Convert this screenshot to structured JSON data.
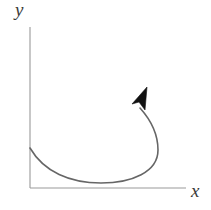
{
  "figure": {
    "type": "vector-diagram",
    "width": 211,
    "height": 210,
    "background_color": "#ffffff"
  },
  "axes": {
    "color": "#999999",
    "stroke_width": 1.1,
    "origin": {
      "x": 30,
      "y": 188
    },
    "y_axis": {
      "label": "y",
      "from": {
        "x": 30,
        "y": 27
      },
      "to": {
        "x": 30,
        "y": 188
      },
      "label_position": {
        "x": 17,
        "y": 3
      }
    },
    "x_axis": {
      "label": "x",
      "from": {
        "x": 30,
        "y": 188
      },
      "to": {
        "x": 186,
        "y": 188
      },
      "label_position": {
        "x": 192,
        "y": 185
      }
    }
  },
  "curve": {
    "name": "trajectory",
    "color": "#666666",
    "stroke_width": 1.6,
    "start_point": {
      "x": 30,
      "y": 148
    },
    "end_point": {
      "x": 140,
      "y": 108
    },
    "lowest_point": {
      "x": 101,
      "y": 183
    },
    "rightmost_point": {
      "x": 158,
      "y": 152
    },
    "path": "M 30 148 C 44 172, 70 183, 101 183 C 132 183, 158 172, 158 150 C 158 132, 149 118, 140 108",
    "direction": "counterclockwise-from-y-axis-sweeping-right-then-upward"
  },
  "arrow_head": {
    "name": "arrowhead",
    "color": "#111111",
    "tip": {
      "x": 147,
      "y": 87
    },
    "base_left": {
      "x": 132,
      "y": 104
    },
    "base_right": {
      "x": 145,
      "y": 110
    },
    "notch": {
      "x": 139,
      "y": 102
    },
    "points": "147,87 132,104 139,102 145,110"
  }
}
